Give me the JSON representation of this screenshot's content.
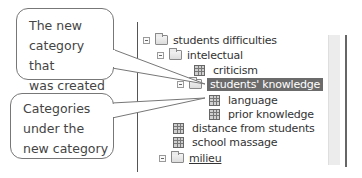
{
  "callouts": [
    {
      "lines": [
        "The new",
        "category that",
        "was created"
      ]
    },
    {
      "lines": [
        "Categories",
        "under the",
        "new category"
      ]
    }
  ],
  "tree": {
    "items": [
      {
        "label": "students difficulties",
        "type": "folder",
        "expanded": true,
        "level": 0
      },
      {
        "label": "intelectual",
        "type": "folder",
        "expanded": true,
        "level": 1
      },
      {
        "label": "criticism",
        "type": "category",
        "level": 2
      },
      {
        "label": "students' knowledge",
        "type": "folder",
        "expanded": true,
        "level": 2,
        "selected": true
      },
      {
        "label": "language",
        "type": "category",
        "level": 3
      },
      {
        "label": "prior knowledge",
        "type": "category",
        "level": 3
      },
      {
        "label": "distance from students",
        "type": "category",
        "level": 1
      },
      {
        "label": "school massage",
        "type": "category",
        "level": 1
      },
      {
        "label": "milieu",
        "type": "folder",
        "expanded": true,
        "level": 1
      }
    ]
  },
  "colors": {
    "selection": "#6b6b6b",
    "border": "#777777"
  }
}
